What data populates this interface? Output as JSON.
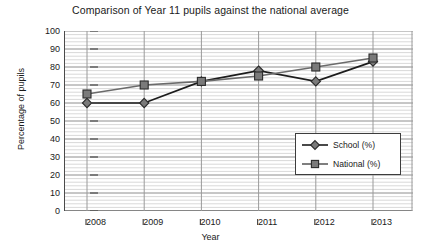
{
  "chart_data": {
    "type": "line",
    "title": "Comparison of Year 11 pupils against the national average",
    "xlabel": "Year",
    "ylabel": "Percentage of pupils",
    "categories": [
      "2008",
      "2009",
      "2010",
      "2011",
      "2012",
      "2013"
    ],
    "x": [
      2008,
      2009,
      2010,
      2011,
      2012,
      2013
    ],
    "series": [
      {
        "name": "School (%)",
        "marker": "diamond",
        "values": [
          60,
          60,
          72,
          78,
          72,
          83
        ]
      },
      {
        "name": "National (%)",
        "marker": "square",
        "values": [
          65,
          70,
          72,
          75,
          80,
          85
        ]
      }
    ],
    "ylim": [
      0,
      100
    ],
    "yticks": [
      0,
      10,
      20,
      30,
      40,
      50,
      60,
      70,
      80,
      90,
      100
    ],
    "ytick_labels": [
      "0",
      "10",
      "20",
      "30",
      "40",
      "50",
      "60",
      "70",
      "80",
      "90",
      "100"
    ],
    "xtick_labels": [
      "2008",
      "2009",
      "2010",
      "2011",
      "2012",
      "2013"
    ],
    "grid": {
      "horizontal_major": true,
      "horizontal_minor": true,
      "minor_step": 2,
      "vertical": true
    },
    "legend": {
      "position": "lower-right-inside",
      "entries": [
        {
          "label": "School (%)",
          "marker": "diamond"
        },
        {
          "label": "National (%)",
          "marker": "square"
        }
      ]
    },
    "colors": {
      "school_line": "#1c1c1c",
      "national_line": "#6b6b6b",
      "marker_fill": "#7a7a7a",
      "marker_edge": "#2b2b2b",
      "axis": "#4a4a4a",
      "grid_major": "#9a9a9a",
      "grid_minor": "#c9c9c9",
      "background": "#ffffff"
    }
  }
}
